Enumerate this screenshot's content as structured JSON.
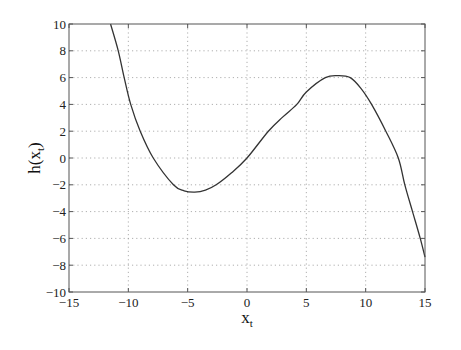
{
  "chart_data": {
    "type": "line",
    "title": "",
    "xlabel": "x_t",
    "ylabel": "h(x_t)",
    "xlabel_main": "x",
    "xlabel_sub": "t",
    "ylabel_main": "h(x",
    "ylabel_sub": "t",
    "ylabel_close": ")",
    "xlim": [
      -15,
      15
    ],
    "ylim": [
      -10,
      10
    ],
    "grid": true,
    "grid_style": "dotted",
    "legend": null,
    "x_ticks": [
      -15,
      -10,
      -5,
      0,
      5,
      10,
      15
    ],
    "y_ticks": [
      -10,
      -8,
      -6,
      -4,
      -2,
      0,
      2,
      4,
      6,
      8,
      10
    ],
    "x_tick_labels": [
      "−15",
      "−10",
      "−5",
      "0",
      "5",
      "10",
      "15"
    ],
    "y_tick_labels": [
      "−10",
      "−8",
      "−6",
      "−4",
      "−2",
      "0",
      "2",
      "4",
      "6",
      "8",
      "10"
    ],
    "series": [
      {
        "name": "h(x_t)",
        "color": "#333333",
        "x": [
          -11.5,
          -10.85,
          -10.35,
          -9.8,
          -9.0,
          -7.9,
          -6.2,
          -5.3,
          -4.4,
          -3.5,
          -2.6,
          -1.3,
          0.0,
          1.8,
          3.0,
          4.2,
          5.0,
          6.6,
          7.7,
          8.7,
          9.6,
          10.5,
          11.7,
          12.75,
          13.3,
          13.95,
          14.6,
          15.0
        ],
        "y": [
          10.0,
          8.0,
          6.0,
          4.0,
          2.0,
          0.0,
          -2.0,
          -2.45,
          -2.55,
          -2.4,
          -2.0,
          -1.1,
          0.0,
          2.0,
          3.05,
          4.0,
          4.93,
          6.0,
          6.15,
          6.0,
          5.2,
          4.0,
          2.0,
          0.0,
          -2.0,
          -4.0,
          -6.0,
          -7.4
        ]
      }
    ],
    "annotations": []
  },
  "layout": {
    "plot_left": 69,
    "plot_top": 24,
    "plot_right": 425,
    "plot_bottom": 292,
    "axis_color": "#555555",
    "grid_color": "#9a9a9a",
    "curve_color": "#333333"
  }
}
